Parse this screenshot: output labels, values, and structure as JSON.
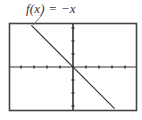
{
  "chart_data": {
    "type": "line",
    "title": "",
    "function_label": "f(x) = −x",
    "series": [
      {
        "name": "f(x) = −x",
        "x": [
          -3.2,
          0,
          3.2
        ],
        "values": [
          3.2,
          0,
          -3.2
        ]
      }
    ],
    "xlabel": "",
    "ylabel": "",
    "xlim": [
      -5,
      5
    ],
    "ylim": [
      -3.4,
      3.4
    ],
    "x_ticks": [
      -4,
      -3,
      -2,
      -1,
      1,
      2,
      3,
      4
    ],
    "y_ticks": [
      -3,
      -2,
      -1,
      1,
      2,
      3
    ],
    "grid": false,
    "legend": "none",
    "annotation": {
      "text": "f(x) = −x",
      "pointer": "leader line to graph near top-left"
    }
  },
  "colors": {
    "axis": "#333333",
    "line": "#333333",
    "frame": "#444444",
    "background": "#ffffff"
  }
}
